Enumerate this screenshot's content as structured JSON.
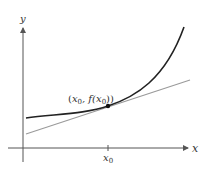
{
  "diagram": {
    "axes": {
      "x_label": "x",
      "y_label": "y",
      "tick_label_main": "x",
      "tick_label_sub": "0"
    },
    "point_label": {
      "open": "(",
      "x": "x",
      "x_sub": "0",
      "comma_f": ", f(",
      "x2": "x",
      "x2_sub": "0",
      "close": "))"
    },
    "colors": {
      "curve": "#222222",
      "tangent": "#9a9a9a",
      "axes": "#555555",
      "point": "#111111"
    }
  }
}
